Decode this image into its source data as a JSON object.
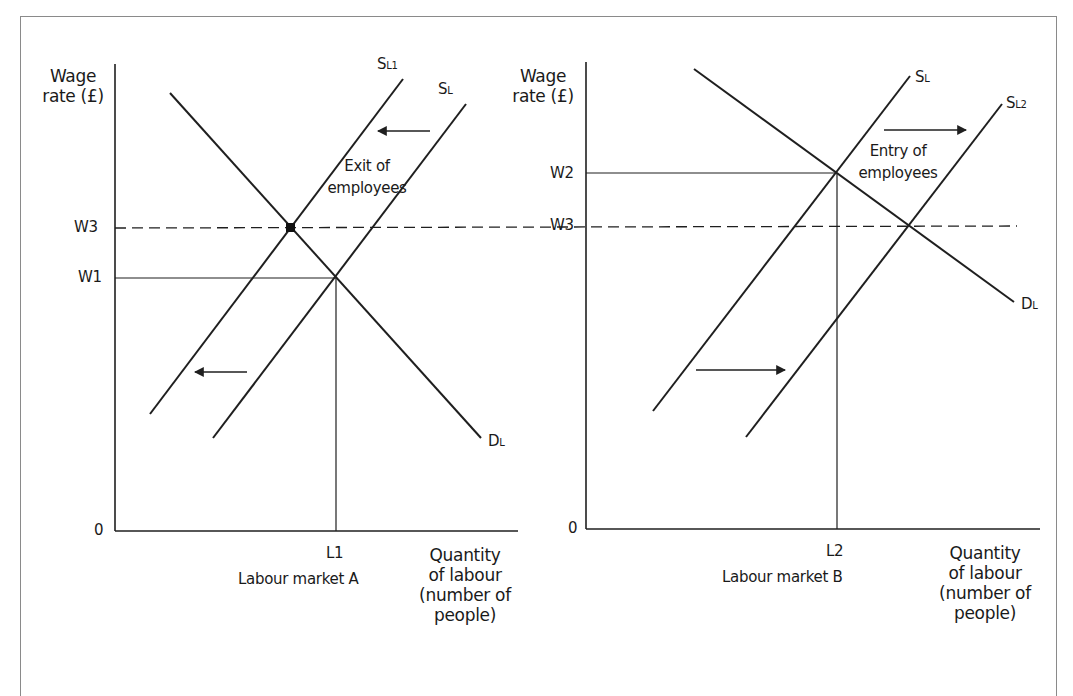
{
  "figure": {
    "panels": [
      {
        "id": "A",
        "caption": "Labour market A",
        "y_axis_title_line1": "Wage",
        "y_axis_title_line2": "rate (£)",
        "x_axis_title_lines": [
          "Quantity",
          "of labour",
          "(number of",
          "people)"
        ],
        "origin_label": "0",
        "y_ticks": [
          "W3",
          "W1"
        ],
        "x_ticks": [
          "L1"
        ],
        "curves": {
          "supply_shifted": {
            "main": "S",
            "sub": "L1"
          },
          "supply_original": {
            "main": "S",
            "sub": "L"
          },
          "demand": {
            "main": "D",
            "sub": "L"
          }
        },
        "annotation_line1": "Exit of",
        "annotation_line2": "employees",
        "shift_direction": "left"
      },
      {
        "id": "B",
        "caption": "Labour market B",
        "y_axis_title_line1": "Wage",
        "y_axis_title_line2": "rate (£)",
        "x_axis_title_lines": [
          "Quantity",
          "of labour",
          "(number of",
          "people)"
        ],
        "origin_label": "0",
        "y_ticks": [
          "W2",
          "W3"
        ],
        "x_ticks": [
          "L2"
        ],
        "curves": {
          "supply_original": {
            "main": "S",
            "sub": "L"
          },
          "supply_shifted": {
            "main": "S",
            "sub": "L2"
          },
          "demand": {
            "main": "D",
            "sub": "L"
          }
        },
        "annotation_line1": "Entry of",
        "annotation_line2": "employees",
        "shift_direction": "right"
      }
    ],
    "colors": {
      "line": "#1f1f1f",
      "frame": "#8a8a8a",
      "background": "#ffffff"
    }
  }
}
